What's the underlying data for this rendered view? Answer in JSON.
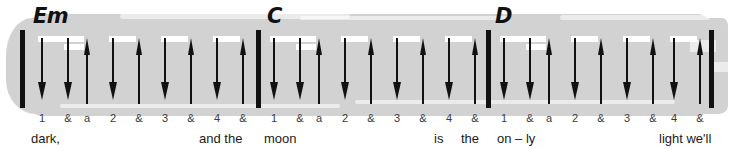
{
  "sheet": {
    "type": "guitar-strumming-pattern",
    "time_signature_counts_per_measure": 9,
    "colors": {
      "highlight": "#d2d2d2",
      "ink": "#111111",
      "count_text": "#3a3a3a",
      "beam": "#ffffff",
      "background": "#ffffff"
    }
  },
  "chords": [
    {
      "label": "Em",
      "x": 33,
      "y": 6
    },
    {
      "label": "C",
      "x": 267,
      "y": 6
    },
    {
      "label": "D",
      "x": 495,
      "y": 6
    }
  ],
  "barlines": [
    {
      "x": 20
    },
    {
      "x": 256
    },
    {
      "x": 486
    },
    {
      "x": 709
    }
  ],
  "measures": [
    {
      "chord": "Em",
      "strums": [
        {
          "count": "1",
          "direction": "down",
          "x": 38
        },
        {
          "count": "&",
          "direction": "down",
          "x": 64
        },
        {
          "count": "a",
          "direction": "up",
          "x": 83
        },
        {
          "count": "2",
          "direction": "down",
          "x": 109
        },
        {
          "count": "&",
          "direction": "up",
          "x": 135
        },
        {
          "count": "3",
          "direction": "down",
          "x": 161
        },
        {
          "count": "&",
          "direction": "up",
          "x": 187
        },
        {
          "count": "4",
          "direction": "down",
          "x": 213
        },
        {
          "count": "&",
          "direction": "up",
          "x": 239
        }
      ],
      "beams": [
        {
          "x": 38,
          "width": 46,
          "row": 0
        },
        {
          "x": 64,
          "width": 20,
          "row": 1
        },
        {
          "x": 109,
          "width": 27,
          "row": 0
        },
        {
          "x": 161,
          "width": 27,
          "row": 0
        },
        {
          "x": 213,
          "width": 27,
          "row": 0
        }
      ]
    },
    {
      "chord": "C",
      "strums": [
        {
          "count": "1",
          "direction": "down",
          "x": 270
        },
        {
          "count": "&",
          "direction": "down",
          "x": 296
        },
        {
          "count": "a",
          "direction": "up",
          "x": 315
        },
        {
          "count": "2",
          "direction": "down",
          "x": 341
        },
        {
          "count": "&",
          "direction": "up",
          "x": 367
        },
        {
          "count": "3",
          "direction": "down",
          "x": 393
        },
        {
          "count": "&",
          "direction": "up",
          "x": 419
        },
        {
          "count": "4",
          "direction": "down",
          "x": 445
        },
        {
          "count": "&",
          "direction": "up",
          "x": 471
        }
      ],
      "beams": [
        {
          "x": 270,
          "width": 46,
          "row": 0
        },
        {
          "x": 296,
          "width": 20,
          "row": 1
        },
        {
          "x": 341,
          "width": 27,
          "row": 0
        },
        {
          "x": 393,
          "width": 27,
          "row": 0
        },
        {
          "x": 445,
          "width": 27,
          "row": 0
        }
      ]
    },
    {
      "chord": "D",
      "strums": [
        {
          "count": "1",
          "direction": "down",
          "x": 500
        },
        {
          "count": "&",
          "direction": "down",
          "x": 526
        },
        {
          "count": "a",
          "direction": "up",
          "x": 545
        },
        {
          "count": "2",
          "direction": "down",
          "x": 571
        },
        {
          "count": "&",
          "direction": "up",
          "x": 597
        },
        {
          "count": "3",
          "direction": "down",
          "x": 623
        },
        {
          "count": "&",
          "direction": "up",
          "x": 649
        },
        {
          "count": "4",
          "direction": "down",
          "x": 670
        },
        {
          "count": "&",
          "direction": "up",
          "x": 696
        }
      ],
      "beams": [
        {
          "x": 500,
          "width": 46,
          "row": 0
        },
        {
          "x": 526,
          "width": 20,
          "row": 1
        },
        {
          "x": 571,
          "width": 27,
          "row": 0
        },
        {
          "x": 623,
          "width": 27,
          "row": 0
        },
        {
          "x": 670,
          "width": 27,
          "row": 0
        }
      ]
    }
  ],
  "lyrics": [
    {
      "text": "dark,",
      "x": 31
    },
    {
      "text": "and the",
      "x": 199
    },
    {
      "text": "moon",
      "x": 264
    },
    {
      "text": "is",
      "x": 434
    },
    {
      "text": "the",
      "x": 461
    },
    {
      "text": "on – ly",
      "x": 497
    },
    {
      "text": "light we'll",
      "x": 659
    }
  ]
}
